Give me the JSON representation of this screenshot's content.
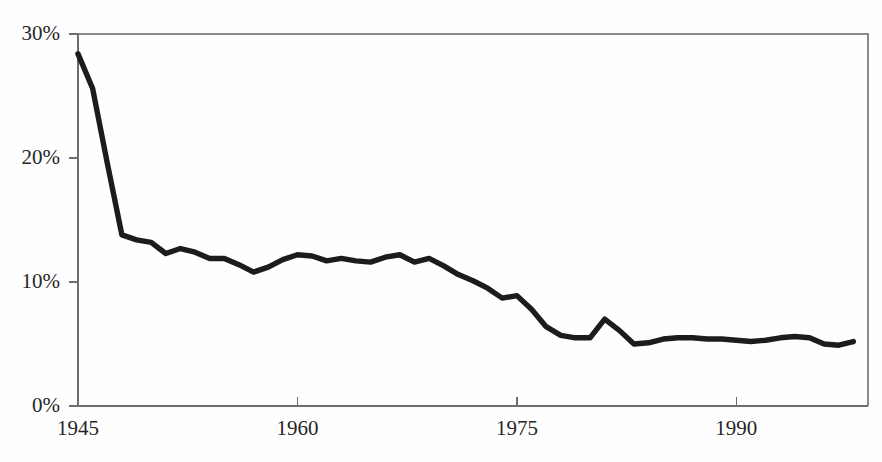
{
  "chart_data": {
    "type": "line",
    "title": "",
    "subtitle": "",
    "xlabel": "",
    "ylabel": "",
    "xlim": [
      1945,
      1999
    ],
    "ylim": [
      0,
      30
    ],
    "grid": false,
    "legend": null,
    "x_tick_labels": [
      "1945",
      "1960",
      "1975",
      "1990"
    ],
    "x_tick_values": [
      1945,
      1960,
      1975,
      1990
    ],
    "y_tick_labels": [
      "0%",
      "10%",
      "20%",
      "30%"
    ],
    "y_tick_values": [
      0,
      10,
      20,
      30
    ],
    "series": [
      {
        "name": "share",
        "color": "#1c1c1c",
        "x": [
          1945,
          1946,
          1947,
          1948,
          1949,
          1950,
          1951,
          1952,
          1953,
          1954,
          1955,
          1956,
          1957,
          1958,
          1959,
          1960,
          1961,
          1962,
          1963,
          1964,
          1965,
          1966,
          1967,
          1968,
          1969,
          1970,
          1971,
          1972,
          1973,
          1974,
          1975,
          1976,
          1977,
          1978,
          1979,
          1980,
          1981,
          1982,
          1983,
          1984,
          1985,
          1986,
          1987,
          1988,
          1989,
          1990,
          1991,
          1992,
          1993,
          1994,
          1995,
          1996,
          1997,
          1998
        ],
        "y": [
          28.4,
          25.6,
          19.6,
          13.8,
          13.4,
          13.2,
          12.3,
          12.7,
          12.4,
          11.9,
          11.9,
          11.4,
          10.8,
          11.2,
          11.8,
          12.2,
          12.1,
          11.7,
          11.9,
          11.7,
          11.6,
          12.0,
          12.2,
          11.6,
          11.9,
          11.3,
          10.6,
          10.1,
          9.5,
          8.7,
          8.9,
          7.8,
          6.4,
          5.7,
          5.5,
          5.5,
          7.0,
          6.1,
          5.0,
          5.1,
          5.4,
          5.5,
          5.5,
          5.4,
          5.4,
          5.3,
          5.2,
          5.3,
          5.5,
          5.6,
          5.5,
          5.0,
          4.9,
          5.2
        ]
      }
    ]
  },
  "axes": {
    "y_axis_name": "percent-axis",
    "x_axis_name": "year-axis"
  }
}
